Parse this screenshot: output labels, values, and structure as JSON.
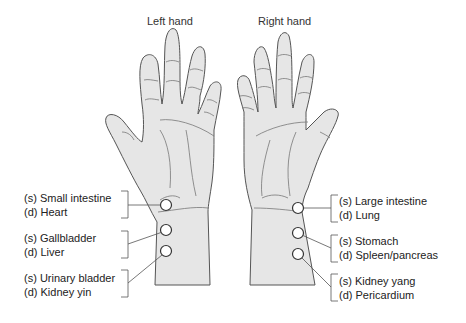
{
  "titles": {
    "left": "Left hand",
    "right": "Right hand"
  },
  "left_hand": {
    "positions": [
      {
        "s": "(s) Small intestine",
        "d": "(d) Heart"
      },
      {
        "s": "(s) Gallbladder",
        "d": "(d) Liver"
      },
      {
        "s": "(s) Urinary bladder",
        "d": "(d) Kidney yin"
      }
    ]
  },
  "right_hand": {
    "positions": [
      {
        "s": "(s) Large intestine",
        "d": "(d) Lung"
      },
      {
        "s": "(s) Stomach",
        "d": "(d) Spleen/pancreas"
      },
      {
        "s": "(s) Kidney yang",
        "d": "(d) Pericardium"
      }
    ]
  },
  "colors": {
    "skin": "#e6e6e6",
    "outline": "#555555",
    "crease": "#777777",
    "leader": "#555555"
  }
}
